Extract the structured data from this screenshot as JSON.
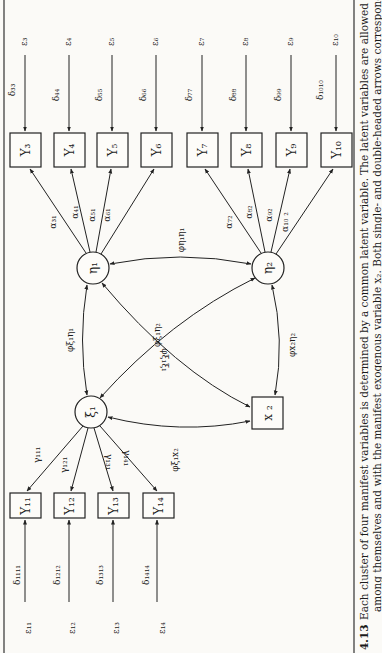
{
  "figure": {
    "number": "4.13",
    "caption_line1": "Each cluster of four manifest variables is determined by a common latent variable. The latent variables are allowed to be correl",
    "caption_line2": "among themselves and with the manifest exogenous variable x₂. Both single- and double-headed arrows correspond to free param"
  },
  "latent": {
    "eta1": "η₁",
    "eta2": "η₂",
    "xi1": "ξ₁"
  },
  "exogenous": {
    "x2": "x ₂"
  },
  "top_indicators": [
    {
      "box": "Y₃",
      "error": "ε₃",
      "variance": "δ₃₃",
      "loading": "α₃₁"
    },
    {
      "box": "Y₄",
      "error": "ε₄",
      "variance": "δ₄₄",
      "loading": "α₄₁"
    },
    {
      "box": "Y₅",
      "error": "ε₅",
      "variance": "δ₅₅",
      "loading": "α₅₁"
    },
    {
      "box": "Y₆",
      "error": "ε₆",
      "variance": "δ₆₆",
      "loading": "α₆₁"
    },
    {
      "box": "Y₇",
      "error": "ε₇",
      "variance": "δ₇₇",
      "loading": "α₇₂"
    },
    {
      "box": "Y₈",
      "error": "ε₈",
      "variance": "δ₈₈",
      "loading": "α₈₂"
    },
    {
      "box": "Y₉",
      "error": "ε₉",
      "variance": "δ₉₉",
      "loading": "α₉₂"
    },
    {
      "box": "Y₁₀",
      "error": "ε₁₀",
      "variance": "δ₁₀₁₀",
      "loading": "α₁₀ ₂"
    }
  ],
  "bottom_indicators": [
    {
      "box": "Y₁₁",
      "error": "ε₁₁",
      "variance": "δ₁₁₁₁",
      "loading": "γ₁₁₁"
    },
    {
      "box": "Y₁₂",
      "error": "ε₁₂",
      "variance": "δ₁₂₁₂",
      "loading": "γ₁₂₁"
    },
    {
      "box": "Y₁₃",
      "error": "ε₁₃",
      "variance": "δ₁₃₁₃",
      "loading": "γ₁₃₁"
    },
    {
      "box": "Y₁₄",
      "error": "ε₁₄",
      "variance": "δ₁₄₁₄",
      "loading": "γ₁₄₁"
    }
  ],
  "covariances": {
    "eta1_eta1": "φη₁η₁",
    "xi1_eta1": "φξ₁η₁",
    "xi1_eta2": "φξ₁η₂",
    "xi1_xi1": "φξ₁ξ₁",
    "x2_eta2": "φx₂η₂",
    "xi1_x2": "φξ₁x₂"
  }
}
